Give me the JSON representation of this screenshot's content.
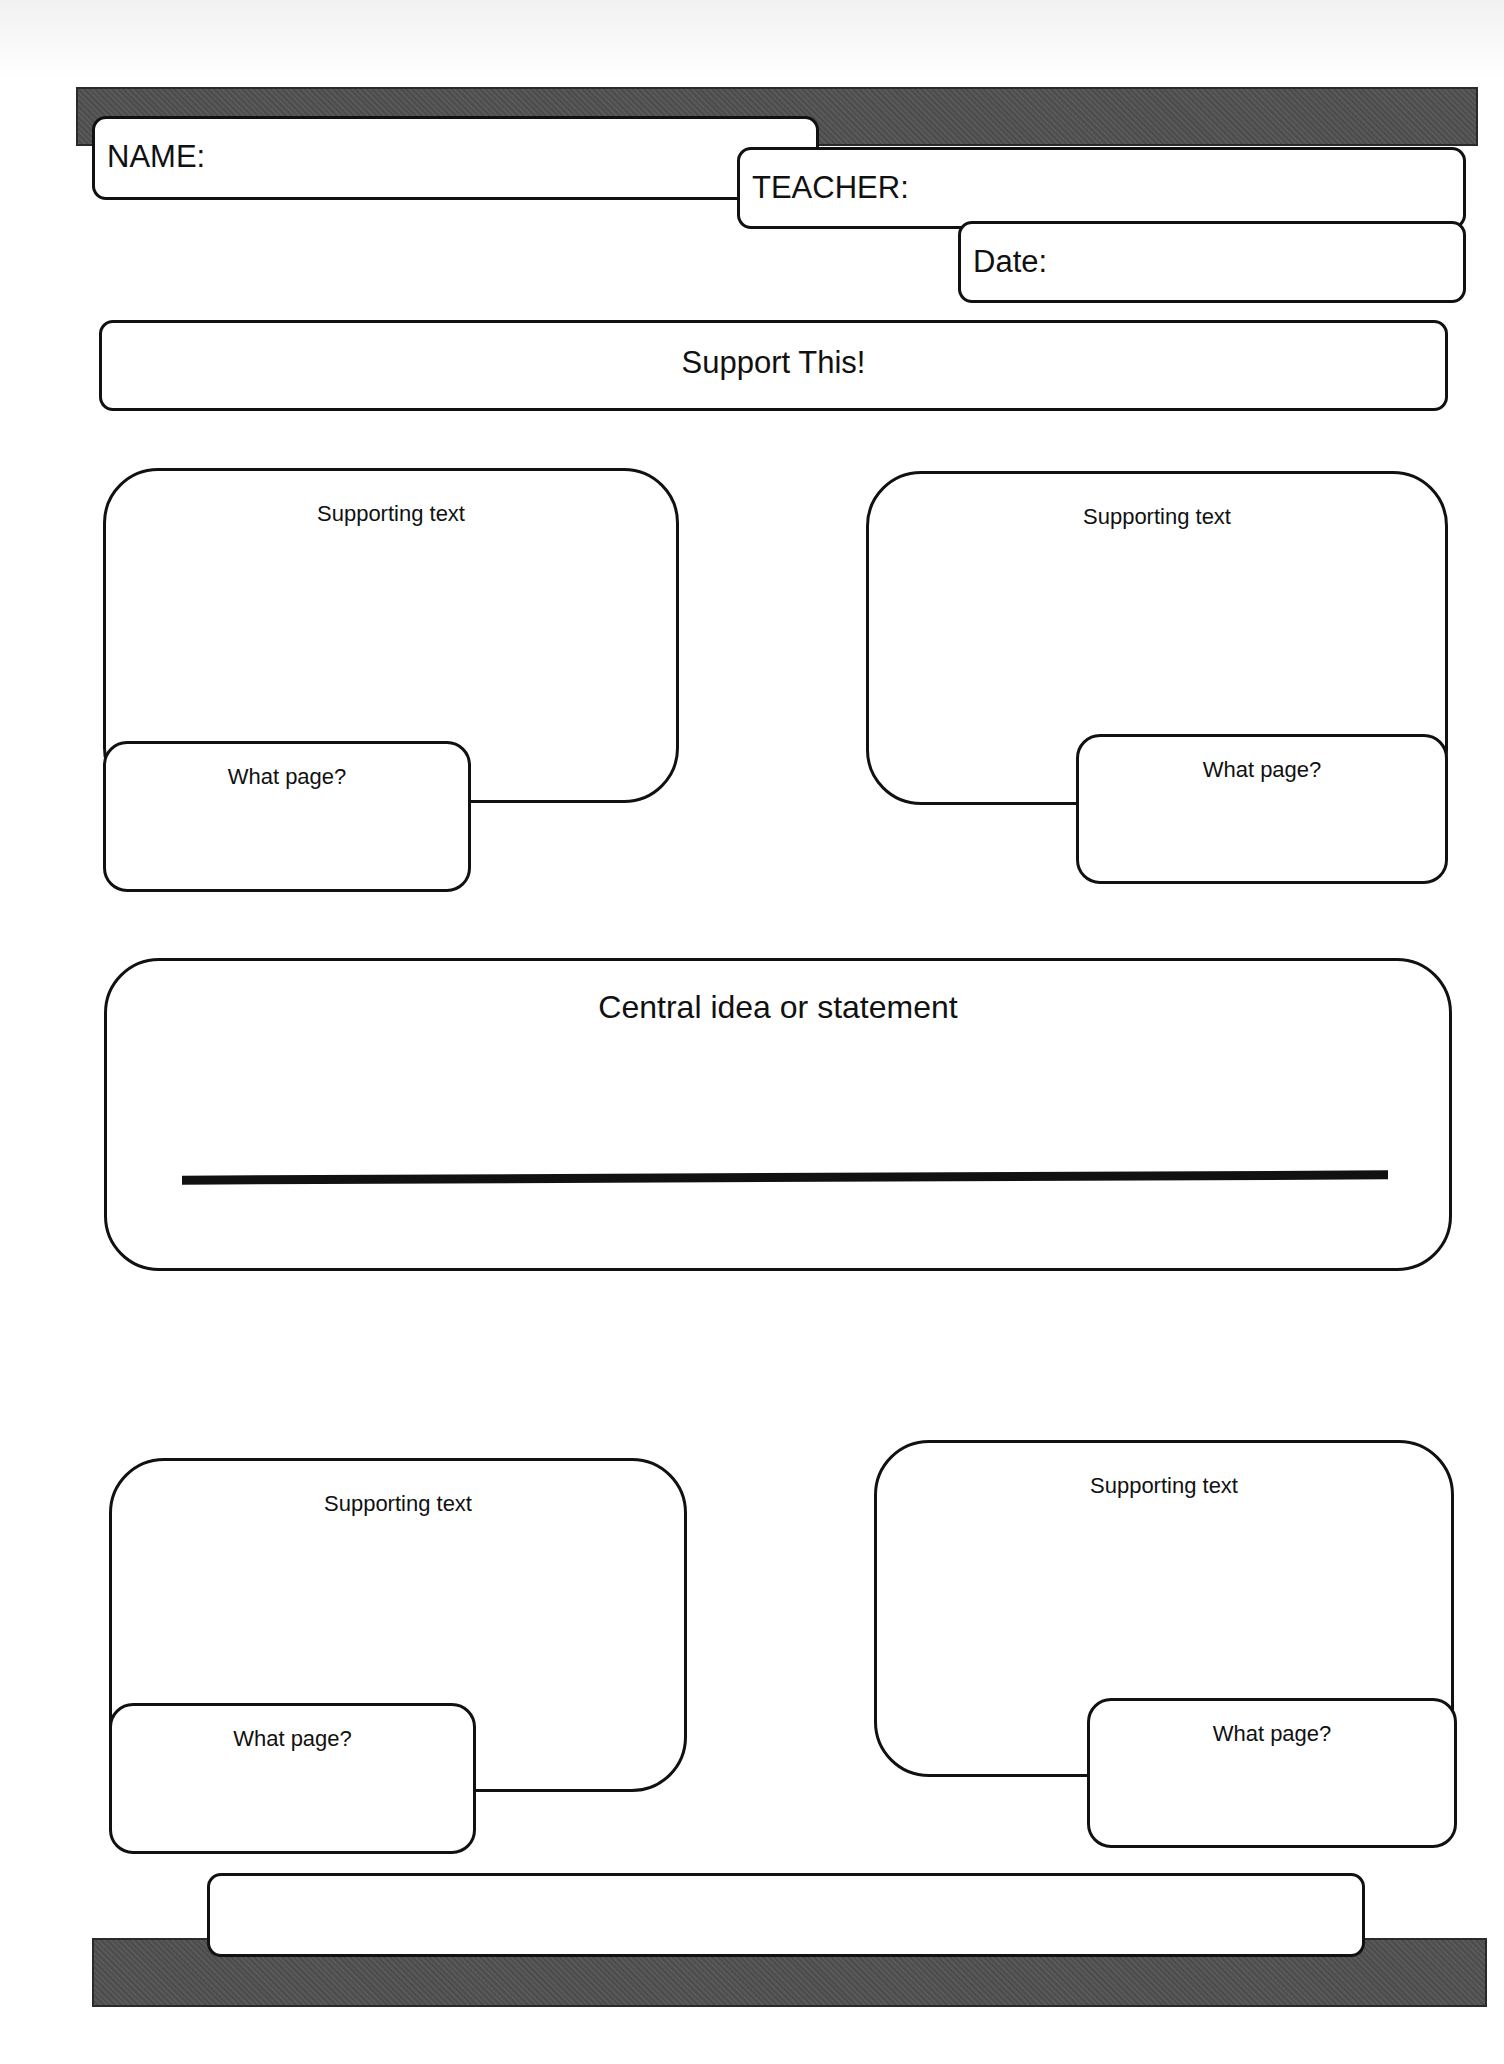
{
  "header": {
    "name_label": "NAME:",
    "teacher_label": "TEACHER:",
    "date_label": "Date:"
  },
  "title_box": {
    "label": "Support This!"
  },
  "supporting_boxes": [
    {
      "label": "Supporting text",
      "page_label": "What page?"
    },
    {
      "label": "Supporting text",
      "page_label": "What page?"
    },
    {
      "label": "Supporting text",
      "page_label": "What page?"
    },
    {
      "label": "Supporting text",
      "page_label": "What page?"
    }
  ],
  "central": {
    "label": "Central idea or statement"
  },
  "colors": {
    "bar": "#505050",
    "outline": "#111111",
    "background": "#ffffff"
  }
}
